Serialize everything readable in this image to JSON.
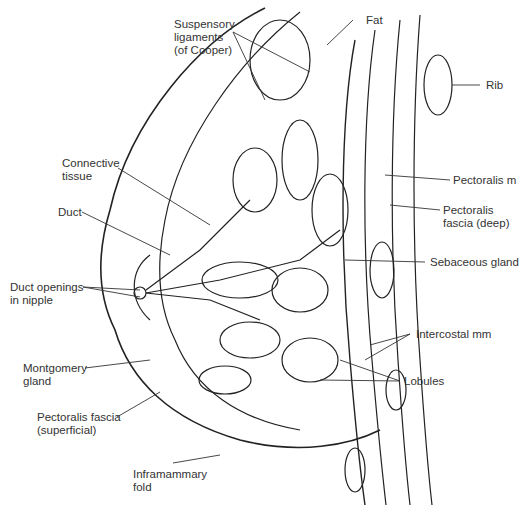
{
  "diagram": {
    "type": "anatomical-illustration",
    "labels": {
      "fat": "Fat",
      "suspensory_ligaments": "Suspensory\nligaments\n(of Cooper)",
      "rib": "Rib",
      "connective_tissue": "Connective\ntissue",
      "pectoralis_m": "Pectoralis m",
      "pectoralis_fascia_deep": "Pectoralis\nfascia (deep)",
      "duct": "Duct",
      "sebaceous_gland": "Sebaceous gland",
      "duct_openings": "Duct openings\nin nipple",
      "intercostal_mm": "Intercostal mm",
      "montgomery_gland": "Montgomery\ngland",
      "lobules": "Lobules",
      "pectoralis_fascia_superficial": "Pectoralis fascia\n(superficial)",
      "inframammary_fold": "Inframammary\nfold"
    },
    "colors": {
      "line": "#222222",
      "text": "#333333",
      "background": "#ffffff"
    }
  }
}
